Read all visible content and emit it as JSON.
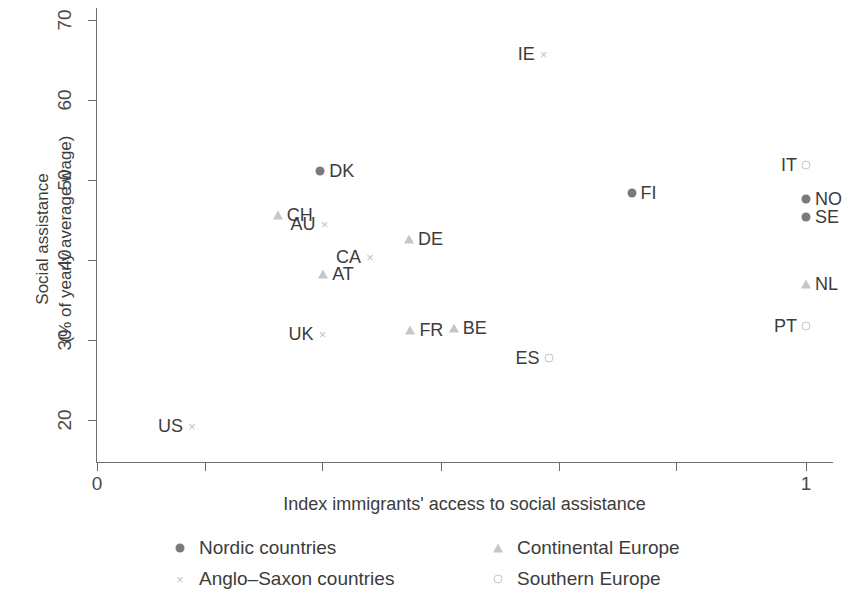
{
  "chart_data": {
    "type": "scatter",
    "title": "",
    "xlabel": "Index immigrants' access to social assistance",
    "ylabel": "Social assistance\n(% of yearly average wage)",
    "ylabel_line1": "Social assistance",
    "ylabel_line2": "(% of yearly average wage)",
    "xlim": [
      0,
      1
    ],
    "ylim": [
      18.4,
      71.5
    ],
    "x_ticks": [
      0,
      1
    ],
    "x_tick_labels": [
      "0",
      "1"
    ],
    "x_minor_ticks": [
      0.152,
      0.318,
      0.485,
      0.651,
      0.817
    ],
    "y_ticks": [
      20,
      30,
      40,
      50,
      60,
      70
    ],
    "y_tick_labels": [
      "20",
      "30",
      "40",
      "50",
      "60",
      "70"
    ],
    "grid": false,
    "legend_position": "below",
    "series": [
      {
        "name": "Nordic countries",
        "marker": "filled-circle",
        "color": "#7a7a7a",
        "points": [
          {
            "label": "DK",
            "x": 0.315,
            "y": 51.1,
            "label_side": "right"
          },
          {
            "label": "FI",
            "x": 0.754,
            "y": 48.4,
            "label_side": "right"
          },
          {
            "label": "NO",
            "x": 1.0,
            "y": 47.6,
            "label_side": "right"
          },
          {
            "label": "SE",
            "x": 1.0,
            "y": 45.4,
            "label_side": "right"
          }
        ]
      },
      {
        "name": "Anglo-Saxon countries",
        "marker": "cross",
        "color": "#c2c2c2",
        "points": [
          {
            "label": "IE",
            "x": 0.63,
            "y": 65.7,
            "label_side": "left"
          },
          {
            "label": "AU",
            "x": 0.321,
            "y": 44.5,
            "label_side": "left"
          },
          {
            "label": "CA",
            "x": 0.385,
            "y": 40.4,
            "label_side": "left"
          },
          {
            "label": "UK",
            "x": 0.318,
            "y": 30.7,
            "label_side": "left"
          },
          {
            "label": "US",
            "x": 0.134,
            "y": 19.2,
            "label_side": "left"
          }
        ]
      },
      {
        "name": "Continental Europe",
        "marker": "triangle",
        "color": "#c6c6c6",
        "points": [
          {
            "label": "CH",
            "x": 0.255,
            "y": 45.6,
            "label_side": "right"
          },
          {
            "label": "DE",
            "x": 0.44,
            "y": 42.6,
            "label_side": "right"
          },
          {
            "label": "AT",
            "x": 0.319,
            "y": 38.2,
            "label_side": "right"
          },
          {
            "label": "NL",
            "x": 1.0,
            "y": 37.0,
            "label_side": "right"
          },
          {
            "label": "FR",
            "x": 0.442,
            "y": 31.3,
            "label_side": "right"
          },
          {
            "label": "BE",
            "x": 0.503,
            "y": 31.5,
            "label_side": "right"
          }
        ]
      },
      {
        "name": "Southern Europe",
        "marker": "open-circle",
        "color": "#c6c6c6",
        "points": [
          {
            "label": "IT",
            "x": 1.0,
            "y": 51.9,
            "label_side": "left"
          },
          {
            "label": "ES",
            "x": 0.637,
            "y": 27.8,
            "label_side": "left"
          },
          {
            "label": "PT",
            "x": 1.0,
            "y": 31.7,
            "label_side": "left"
          }
        ]
      }
    ]
  },
  "legend": {
    "items": [
      {
        "label": "Nordic countries",
        "marker": "filled-circle"
      },
      {
        "label": "Continental Europe",
        "marker": "triangle"
      },
      {
        "label": "Anglo–Saxon countries",
        "marker": "cross"
      },
      {
        "label": "Southern Europe",
        "marker": "open-circle"
      }
    ]
  }
}
